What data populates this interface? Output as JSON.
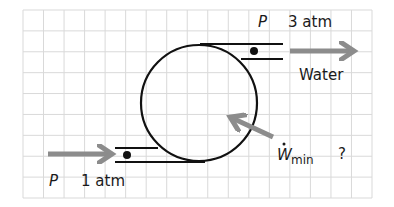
{
  "diagram": {
    "type": "pump-schematic",
    "grid": {
      "left": 23,
      "top": 10,
      "right": 372,
      "bottom": 198,
      "cols": 17,
      "rows": 9,
      "color": "#d9d9d9"
    },
    "colors": {
      "line": "#111111",
      "arrow": "#8c8c8c",
      "text": "#1a1a1a",
      "background": "#ffffff"
    },
    "device": {
      "shape": "circle",
      "cx": 199,
      "cy": 103,
      "r": 58
    },
    "outlet": {
      "pressure_symbol": "P",
      "pressure_value": "3 atm",
      "fluid_label": "Water"
    },
    "inlet": {
      "pressure_symbol": "P",
      "pressure_value": "1 atm"
    },
    "work_input": {
      "symbol": "W",
      "subscript": "min",
      "dot_over": true,
      "value": "?"
    }
  }
}
